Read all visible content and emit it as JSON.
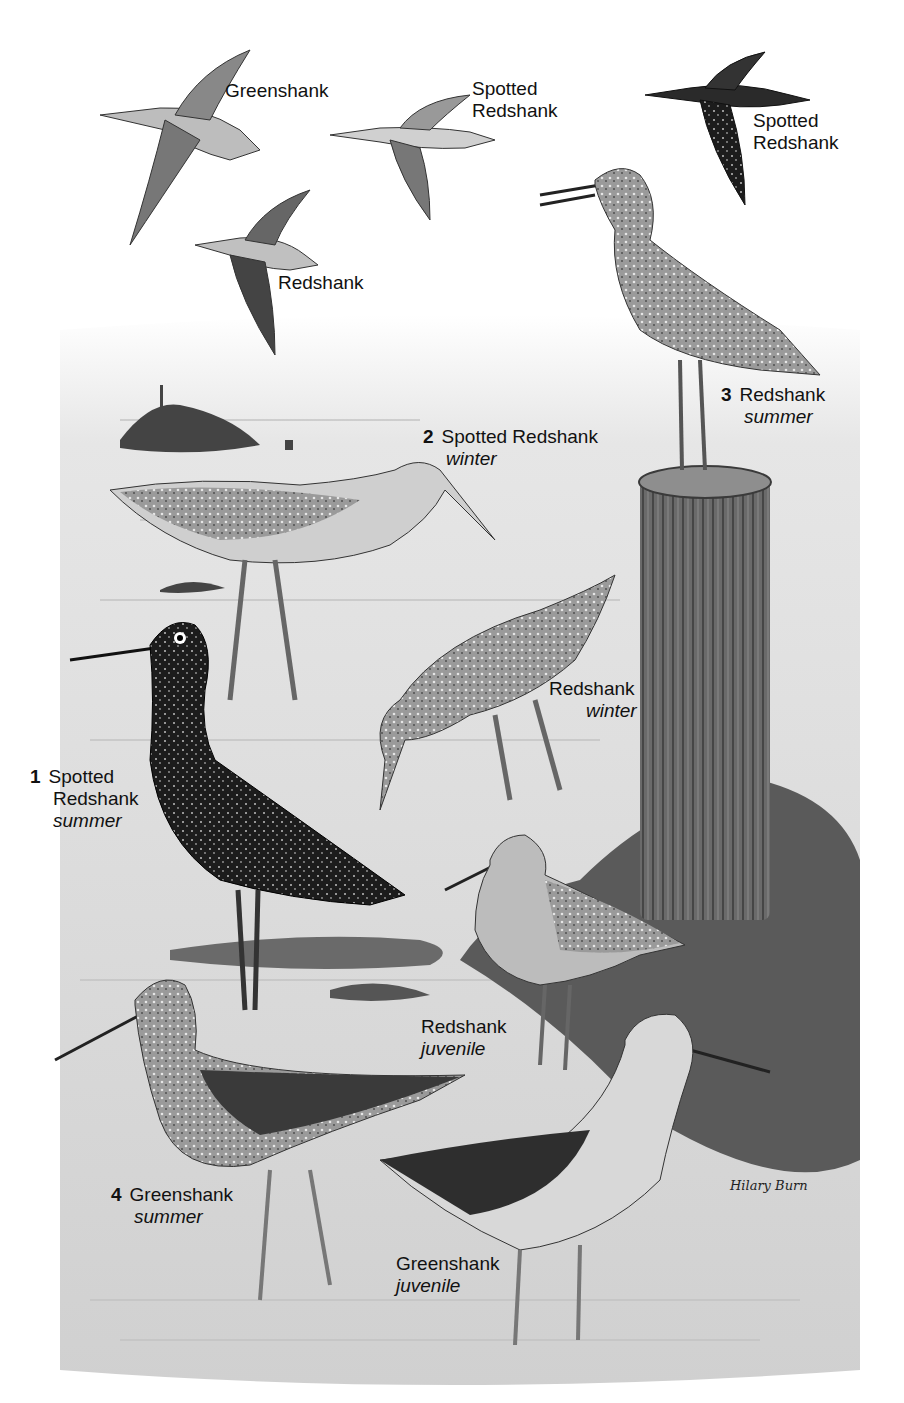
{
  "plate": {
    "illustrator_signature": "Hilary Burn",
    "palette": {
      "paper": "#ffffff",
      "water": "#d9d9d9",
      "ink": "#111111",
      "dark_bird": "#1a1a1a",
      "mid_gray": "#8a8a8a",
      "post": "#5a5a5a"
    }
  },
  "flight_labels": [
    {
      "id": "greenshank-flight",
      "line1": "Greenshank"
    },
    {
      "id": "spotted-redshank-flight-1",
      "line1": "Spotted",
      "line2": "Redshank"
    },
    {
      "id": "spotted-redshank-flight-2",
      "line1": "Spotted",
      "line2": "Redshank"
    },
    {
      "id": "redshank-flight",
      "line1": "Redshank"
    }
  ],
  "numbered_labels": [
    {
      "number": "1",
      "line1": "Spotted",
      "line2": "Redshank",
      "season": "summer"
    },
    {
      "number": "2",
      "line1": "Spotted Redshank",
      "season": "winter"
    },
    {
      "number": "3",
      "line1": "Redshank",
      "season": "summer"
    },
    {
      "number": "4",
      "line1": "Greenshank",
      "season": "summer"
    }
  ],
  "other_labels": [
    {
      "id": "redshank-winter",
      "line1": "Redshank",
      "season": "winter"
    },
    {
      "id": "redshank-juvenile",
      "line1": "Redshank",
      "season": "juvenile"
    },
    {
      "id": "greenshank-juvenile",
      "line1": "Greenshank",
      "season": "juvenile"
    }
  ]
}
